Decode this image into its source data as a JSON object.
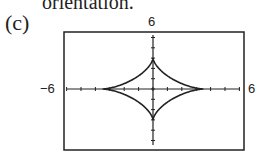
{
  "header_text": "orientation.",
  "part_label": "(c)",
  "chart_data": {
    "type": "line",
    "title": "",
    "xlabel": "",
    "ylabel": "",
    "xlim": [
      -6,
      6
    ],
    "ylim": [
      -6,
      6
    ],
    "x_tick_labels": [
      "-6",
      "6"
    ],
    "y_tick_labels": [
      "6"
    ],
    "grid": false,
    "cusps": [
      [
        3.5,
        0
      ],
      [
        0,
        3
      ],
      [
        -3.5,
        0
      ],
      [
        0,
        -3
      ]
    ]
  },
  "labels": {
    "x_min": "−6",
    "x_max": "6",
    "y_max": "6"
  }
}
